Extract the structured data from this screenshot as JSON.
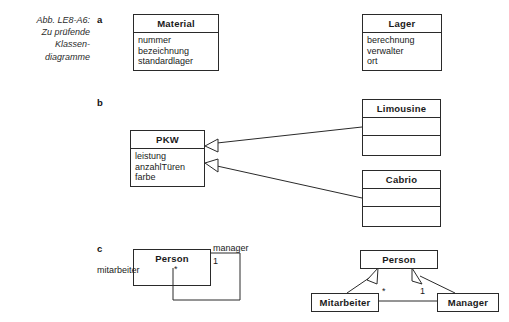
{
  "figure": {
    "caption_lines": [
      "Abb. LE8-A6:",
      "Zu prüfende",
      "Klassen-",
      "diagramme"
    ],
    "section_labels": {
      "a": "a",
      "b": "b",
      "c": "c"
    }
  },
  "section_a": {
    "material": {
      "name": "Material",
      "attributes": [
        "nummer",
        "bezeichnung",
        "standardlager"
      ]
    },
    "lager": {
      "name": "Lager",
      "attributes": [
        "berechnung",
        "verwalter",
        "ort"
      ]
    }
  },
  "section_b": {
    "pkw": {
      "name": "PKW",
      "attributes": [
        "leistung",
        "anzahlTüren",
        "farbe"
      ]
    },
    "limousine": {
      "name": "Limousine",
      "attributes": []
    },
    "cabrio": {
      "name": "Cabrio",
      "attributes": []
    }
  },
  "section_c_left": {
    "person": {
      "name": "Person"
    },
    "association": {
      "role_manager": "manager",
      "multiplicity_manager": "1",
      "role_mitarbeiter": "mitarbeiter",
      "multiplicity_mitarbeiter": "*"
    }
  },
  "section_c_right": {
    "person": {
      "name": "Person"
    },
    "mitarbeiter": {
      "name": "Mitarbeiter"
    },
    "manager": {
      "name": "Manager"
    },
    "association": {
      "multiplicity_mitarbeiter": "*",
      "multiplicity_manager": "1"
    }
  },
  "colors": {
    "background": "#ffffff",
    "line": "#2a2a2a",
    "text": "#1a1a1a"
  }
}
